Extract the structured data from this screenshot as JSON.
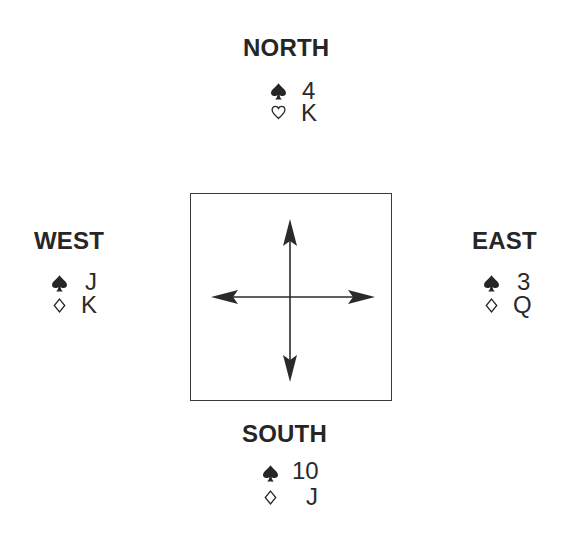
{
  "diagram": {
    "type": "bridge-deal-diagram",
    "hands": {
      "north": {
        "label": "NORTH",
        "cards": [
          {
            "suit": "spades",
            "suit_icon": "spade-icon",
            "rank": "4"
          },
          {
            "suit": "hearts",
            "suit_icon": "heart-outline-icon",
            "rank": "K"
          }
        ]
      },
      "west": {
        "label": "WEST",
        "cards": [
          {
            "suit": "spades",
            "suit_icon": "spade-icon",
            "rank": "J"
          },
          {
            "suit": "diamonds",
            "suit_icon": "diamond-outline-icon",
            "rank": "K"
          }
        ]
      },
      "east": {
        "label": "EAST",
        "cards": [
          {
            "suit": "spades",
            "suit_icon": "spade-icon",
            "rank": "3"
          },
          {
            "suit": "diamonds",
            "suit_icon": "diamond-outline-icon",
            "rank": "Q"
          }
        ]
      },
      "south": {
        "label": "SOUTH",
        "cards": [
          {
            "suit": "spades",
            "suit_icon": "spade-icon",
            "rank": "10"
          },
          {
            "suit": "diamonds",
            "suit_icon": "diamond-outline-icon",
            "rank": "J"
          }
        ]
      }
    },
    "center": {
      "element": "table-box",
      "arrows": [
        "up",
        "down",
        "left",
        "right"
      ]
    },
    "colors": {
      "ink": "#262626",
      "background": "#ffffff"
    }
  }
}
